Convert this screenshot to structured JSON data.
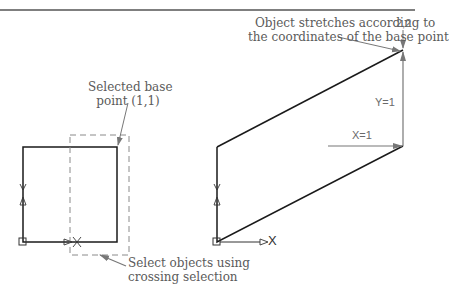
{
  "figure": {
    "colors": {
      "object_line": "#1a1a1a",
      "annotation": "#777777",
      "dashed_window": "#8a8a8a",
      "header_rule": "#555555",
      "text": "#5a5a5a"
    },
    "callouts": {
      "stretch_note_line1": "Object stretches according to",
      "stretch_note_line2": "the coordinates of the base point",
      "base_point_line1": "Selected base",
      "base_point_line2": "point (1,1)",
      "crossing_line1": "Select objects using",
      "crossing_line2": "crossing selection"
    },
    "labels": {
      "target_point": "2,2",
      "y_displacement": "Y=1",
      "x_displacement": "X=1",
      "ucs_x_left": "X",
      "ucs_x_right": "X"
    },
    "left_panel": {
      "description": "Original square with crossing selection window",
      "square": {
        "x1": 23,
        "y1": 147,
        "x2": 117,
        "y2": 242
      },
      "crossing_window": {
        "x1": 70,
        "y1": 135,
        "x2": 129,
        "y2": 255
      }
    },
    "right_panel": {
      "description": "Stretched object (parallelogram)",
      "points": [
        [
          217,
          242
        ],
        [
          217,
          147
        ],
        [
          403,
          50
        ],
        [
          403,
          146
        ]
      ]
    }
  }
}
